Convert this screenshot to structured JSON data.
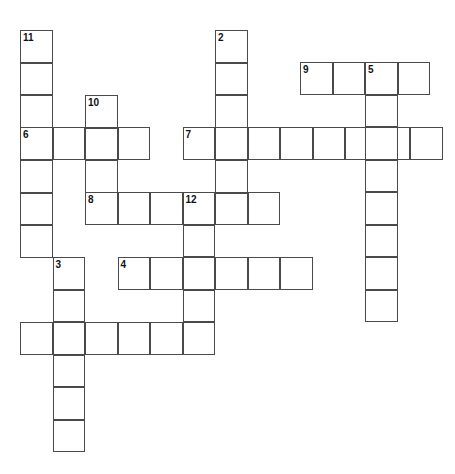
{
  "puzzle": {
    "title": "Crossword Puzzle Grid",
    "grid": {
      "cell_size": 32.5,
      "origin_x": 20,
      "origin_y": 30,
      "width_px": 455,
      "height_px": 474,
      "background_color": "#ffffff",
      "cell_fill": "#ffffff",
      "cell_border_color": "#4a4a4a",
      "number_color": "#111111"
    },
    "entries": [
      {
        "number": "1",
        "direction": "across",
        "x": 20,
        "y": 322,
        "length": 6
      },
      {
        "number": "2",
        "direction": "down",
        "x": 215,
        "y": 30,
        "length": 6
      },
      {
        "number": "3",
        "direction": "down",
        "x": 52.5,
        "y": 257,
        "length": 6
      },
      {
        "number": "4",
        "direction": "across",
        "x": 117.5,
        "y": 257,
        "length": 6
      },
      {
        "number": "5",
        "direction": "down",
        "x": 365,
        "y": 62,
        "length": 8
      },
      {
        "number": "6",
        "direction": "across",
        "x": 20,
        "y": 127,
        "length": 4
      },
      {
        "number": "7",
        "direction": "across",
        "x": 182.5,
        "y": 127,
        "length": 8
      },
      {
        "number": "8",
        "direction": "across",
        "x": 85,
        "y": 192,
        "length": 6
      },
      {
        "number": "9",
        "direction": "across",
        "x": 300,
        "y": 62,
        "length": 4
      },
      {
        "number": "10",
        "direction": "down",
        "x": 85,
        "y": 95,
        "length": 4
      },
      {
        "number": "11",
        "direction": "down",
        "x": 20,
        "y": 30,
        "length": 7
      },
      {
        "number": "12",
        "direction": "down",
        "x": 182.5,
        "y": 192,
        "length": 5
      }
    ],
    "cells": [
      {
        "name": "cell-r0-c0",
        "x": 20,
        "y": 30,
        "number": "11"
      },
      {
        "name": "cell-r1-c0",
        "x": 20,
        "y": 62,
        "number": ""
      },
      {
        "name": "cell-r2-c0",
        "x": 20,
        "y": 95,
        "number": ""
      },
      {
        "name": "cell-r3-c0",
        "x": 20,
        "y": 127,
        "number": "6"
      },
      {
        "name": "cell-r4-c0",
        "x": 20,
        "y": 160,
        "number": ""
      },
      {
        "name": "cell-r5-c0",
        "x": 20,
        "y": 192,
        "number": ""
      },
      {
        "name": "cell-r6-c0",
        "x": 20,
        "y": 225,
        "number": ""
      },
      {
        "name": "cell-r3-c1",
        "x": 52.5,
        "y": 127,
        "number": ""
      },
      {
        "name": "cell-r7-c1",
        "x": 52.5,
        "y": 257,
        "number": "3"
      },
      {
        "name": "cell-r8-c1",
        "x": 52.5,
        "y": 290,
        "number": ""
      },
      {
        "name": "cell-r9-c1",
        "x": 52.5,
        "y": 322,
        "number": ""
      },
      {
        "name": "cell-r10-c1",
        "x": 52.5,
        "y": 355,
        "number": ""
      },
      {
        "name": "cell-r11-c1",
        "x": 52.5,
        "y": 387,
        "number": ""
      },
      {
        "name": "cell-r12-c1",
        "x": 52.5,
        "y": 420,
        "number": ""
      },
      {
        "name": "cell-r2-c2",
        "x": 85,
        "y": 95,
        "number": "10"
      },
      {
        "name": "cell-r3-c2",
        "x": 85,
        "y": 127,
        "number": ""
      },
      {
        "name": "cell-r4-c2",
        "x": 85,
        "y": 160,
        "number": ""
      },
      {
        "name": "cell-r5-c2",
        "x": 85,
        "y": 192,
        "number": "8"
      },
      {
        "name": "cell-r3-c3",
        "x": 117.5,
        "y": 127,
        "number": ""
      },
      {
        "name": "cell-r5-c3",
        "x": 117.5,
        "y": 192,
        "number": ""
      },
      {
        "name": "cell-r7-c3",
        "x": 117.5,
        "y": 257,
        "number": "4"
      },
      {
        "name": "cell-r5-c4",
        "x": 150,
        "y": 192,
        "number": ""
      },
      {
        "name": "cell-r7-c4",
        "x": 150,
        "y": 257,
        "number": ""
      },
      {
        "name": "cell-r9-c4",
        "x": 150,
        "y": 322,
        "number": ""
      },
      {
        "name": "cell-r3-c5",
        "x": 182.5,
        "y": 127,
        "number": "7"
      },
      {
        "name": "cell-r5-c5",
        "x": 182.5,
        "y": 192,
        "number": "12"
      },
      {
        "name": "cell-r6-c5",
        "x": 182.5,
        "y": 225,
        "number": ""
      },
      {
        "name": "cell-r7-c5",
        "x": 182.5,
        "y": 257,
        "number": ""
      },
      {
        "name": "cell-r8-c5",
        "x": 182.5,
        "y": 290,
        "number": ""
      },
      {
        "name": "cell-r9-c5",
        "x": 182.5,
        "y": 322,
        "number": ""
      },
      {
        "name": "cell-r0-c6",
        "x": 215,
        "y": 30,
        "number": "2"
      },
      {
        "name": "cell-r1-c6",
        "x": 215,
        "y": 62,
        "number": ""
      },
      {
        "name": "cell-r2-c6",
        "x": 215,
        "y": 95,
        "number": ""
      },
      {
        "name": "cell-r3-c6",
        "x": 215,
        "y": 127,
        "number": ""
      },
      {
        "name": "cell-r4-c6",
        "x": 215,
        "y": 160,
        "number": ""
      },
      {
        "name": "cell-r5-c6",
        "x": 215,
        "y": 192,
        "number": ""
      },
      {
        "name": "cell-r1-c8",
        "x": 300,
        "y": 62,
        "number": "9"
      },
      {
        "name": "cell-r1-c9",
        "x": 332.5,
        "y": 62,
        "number": ""
      },
      {
        "name": "cell-r1-c10",
        "x": 365,
        "y": 62,
        "number": "5"
      },
      {
        "name": "cell-r1-c11",
        "x": 397.5,
        "y": 62,
        "number": ""
      }
    ],
    "word_rects": [
      {
        "name": "word-11-down",
        "x": 20,
        "y": 30,
        "w": 32.5,
        "h": 227.5,
        "cells": 7,
        "orient": "v",
        "number": "11"
      },
      {
        "name": "word-6-across",
        "x": 20,
        "y": 127,
        "w": 130,
        "h": 32.5,
        "cells": 4,
        "orient": "h",
        "number": "6"
      },
      {
        "name": "word-10-down",
        "x": 85,
        "y": 95,
        "w": 32.5,
        "h": 130,
        "cells": 4,
        "orient": "v",
        "number": "10"
      },
      {
        "name": "word-8-across",
        "x": 85,
        "y": 192,
        "w": 195,
        "h": 32.5,
        "cells": 6,
        "orient": "h",
        "number": "8"
      },
      {
        "name": "word-2-down",
        "x": 215,
        "y": 30,
        "w": 32.5,
        "h": 195,
        "cells": 6,
        "orient": "v",
        "number": "2"
      },
      {
        "name": "word-7-across",
        "x": 182.5,
        "y": 127,
        "w": 260,
        "h": 32.5,
        "cells": 8,
        "orient": "h",
        "number": "7"
      },
      {
        "name": "word-9-across",
        "x": 300,
        "y": 62,
        "w": 130,
        "h": 32.5,
        "cells": 4,
        "orient": "h",
        "number": "9"
      },
      {
        "name": "word-5-down",
        "x": 365,
        "y": 62,
        "w": 32.5,
        "h": 260,
        "cells": 8,
        "orient": "v",
        "number": "5"
      },
      {
        "name": "word-12-down",
        "x": 182.5,
        "y": 192,
        "w": 32.5,
        "h": 162.5,
        "cells": 5,
        "orient": "v",
        "number": "12"
      },
      {
        "name": "word-4-across",
        "x": 117.5,
        "y": 257,
        "w": 195,
        "h": 32.5,
        "cells": 6,
        "orient": "h",
        "number": "4"
      },
      {
        "name": "word-3-down",
        "x": 52.5,
        "y": 257,
        "w": 32.5,
        "h": 195,
        "cells": 6,
        "orient": "v",
        "number": "3"
      },
      {
        "name": "word-1-across",
        "x": 20,
        "y": 322,
        "w": 195,
        "h": 32.5,
        "cells": 6,
        "orient": "h",
        "number": "1"
      }
    ]
  }
}
